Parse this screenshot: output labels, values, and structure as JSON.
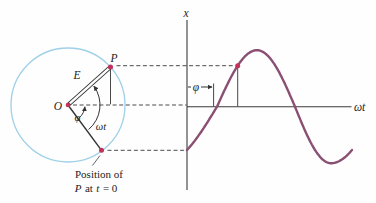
{
  "figure": {
    "colors": {
      "circle": "#9fd0e8",
      "curve": "#8a4f72",
      "marker": "#c2315a",
      "line": "#3a3a3a"
    },
    "phasor_panel": {
      "label_P": "P",
      "label_E": "E",
      "label_O": "O",
      "label_phi": "φ",
      "label_omega_t": "ωt",
      "caption_line1": "Position of",
      "caption_line2_parts": {
        "p": "P",
        "at": "at",
        "t": "t",
        "eq": "= 0"
      }
    },
    "graph_panel": {
      "y_axis_label": "x",
      "x_axis_label": "ωt",
      "phi_label": "φ"
    },
    "chart_data": {
      "type": "line",
      "function": "x = A sin(ωt − φ)",
      "xlabel": "ωt",
      "ylabel": "x",
      "phase_offset_phi_deg": 50,
      "marked_point_phase_after_zero_deg": 47,
      "phase_start_deg": -50,
      "phase_end_deg": 310,
      "phase_anchors_deg": [
        -50,
        0,
        90,
        180,
        270,
        310
      ],
      "anchor_x_px": [
        187,
        217,
        257,
        295,
        331,
        352
      ],
      "axis_y_px": 106.7,
      "amplitude_px": 56.5
    }
  }
}
